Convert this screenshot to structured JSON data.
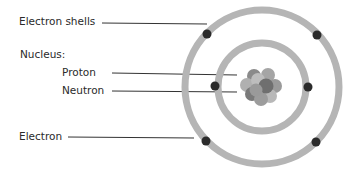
{
  "labels": {
    "electron_shells": "Electron shells",
    "nucleus": "Nucleus:",
    "proton": "Proton",
    "neutron": "Neutron",
    "electron": "Electron"
  },
  "colors": {
    "shell": "#b5b5b5",
    "electron": "#2b2b2b",
    "leader_line": "#333333",
    "text": "#2a2a2a",
    "proton": "#7d7d7d",
    "neutron": "#a8a8a8"
  }
}
